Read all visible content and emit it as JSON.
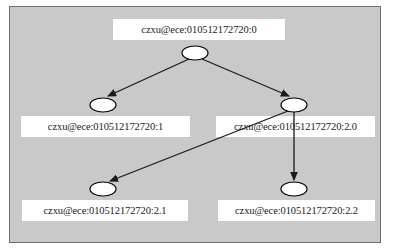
{
  "diagram": {
    "type": "tree",
    "title": "",
    "panel_color": "#c9c9c9",
    "panel_border_color": "#6f6f6f",
    "node_fill": "#ffffff",
    "node_stroke": "#000000",
    "edge_color": "#1a1a1a",
    "label_background": "#ffffff",
    "label_text_color": "#1a1a1a",
    "nodes": [
      {
        "id": "root",
        "label": "czxu@ece:010512172720:0",
        "ellipse": {
          "cx": 195,
          "cy": 53,
          "rx": 13,
          "ry": 7
        },
        "label_box": {
          "left": 113,
          "top": 19,
          "width": 172
        }
      },
      {
        "id": "child1",
        "label": "czxu@ece:010512172720:1",
        "ellipse": {
          "cx": 103,
          "cy": 105,
          "rx": 13,
          "ry": 7
        },
        "label_box": {
          "left": 21,
          "top": 116,
          "width": 169
        }
      },
      {
        "id": "child2",
        "label": "czxu@ece:010512172720:2.0",
        "ellipse": {
          "cx": 294,
          "cy": 105,
          "rx": 13,
          "ry": 7
        },
        "label_box": {
          "left": 216,
          "top": 116,
          "width": 159
        }
      },
      {
        "id": "child21",
        "label": "czxu@ece:010512172720:2.1",
        "ellipse": {
          "cx": 103,
          "cy": 189,
          "rx": 13,
          "ry": 7
        },
        "label_box": {
          "left": 22,
          "top": 200,
          "width": 166
        }
      },
      {
        "id": "child22",
        "label": "czxu@ece:010512172720:2.2",
        "ellipse": {
          "cx": 294,
          "cy": 189,
          "rx": 13,
          "ry": 7
        },
        "label_box": {
          "left": 218,
          "top": 200,
          "width": 157
        }
      }
    ],
    "edges": [
      {
        "from": "root",
        "to": "child1"
      },
      {
        "from": "root",
        "to": "child2"
      },
      {
        "from": "child2",
        "to": "child21"
      },
      {
        "from": "child2",
        "to": "child22"
      }
    ]
  }
}
